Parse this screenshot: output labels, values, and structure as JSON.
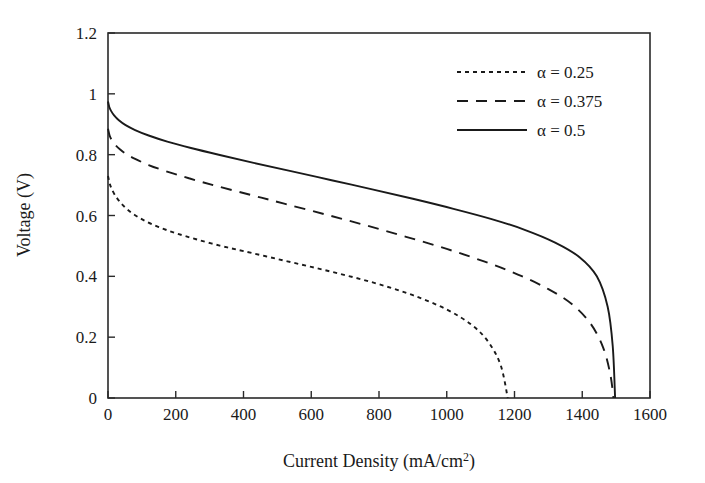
{
  "chart_data": {
    "type": "line",
    "title": "",
    "xlabel": "Current Density (mA/cm2)",
    "xlabel_main": "Current Density (mA/cm",
    "xlabel_sup": "2",
    "xlabel_tail": ")",
    "ylabel": "Voltage (V)",
    "xlim": [
      0,
      1600
    ],
    "ylim": [
      0,
      1.2
    ],
    "grid": false,
    "legend_position": "top-right",
    "xticks": [
      0,
      200,
      400,
      600,
      800,
      1000,
      1200,
      1400,
      1600
    ],
    "xtick_labels": [
      "0",
      "200",
      "400",
      "600",
      "800",
      "1000",
      "1200",
      "1400",
      "1600"
    ],
    "yticks": [
      0,
      0.2,
      0.4,
      0.6,
      0.8,
      1,
      1.2
    ],
    "ytick_labels": [
      "0",
      "0.2",
      "0.4",
      "0.6",
      "0.8",
      "1",
      "1.2"
    ],
    "series": [
      {
        "name": "alpha = 0.25",
        "legend_label": "α = 0.25",
        "style": "dotted",
        "dasharray": "4,4",
        "color": "#1a1a1a",
        "x": [
          0,
          5,
          10,
          20,
          35,
          55,
          80,
          110,
          150,
          200,
          260,
          330,
          400,
          500,
          600,
          700,
          800,
          900,
          1000,
          1075,
          1125,
          1160,
          1180
        ],
        "y": [
          0.73,
          0.705,
          0.69,
          0.668,
          0.645,
          0.622,
          0.601,
          0.582,
          0.562,
          0.542,
          0.522,
          0.501,
          0.483,
          0.457,
          0.431,
          0.404,
          0.374,
          0.338,
          0.291,
          0.239,
          0.181,
          0.105,
          0.0
        ]
      },
      {
        "name": "alpha = 0.375",
        "legend_label": "α = 0.375",
        "style": "dashed",
        "dasharray": "11,8",
        "color": "#1a1a1a",
        "x": [
          0,
          5,
          10,
          20,
          35,
          55,
          80,
          120,
          170,
          240,
          320,
          420,
          520,
          640,
          760,
          880,
          1000,
          1110,
          1210,
          1300,
          1370,
          1425,
          1462,
          1483,
          1492
        ],
        "y": [
          0.885,
          0.862,
          0.85,
          0.834,
          0.818,
          0.801,
          0.786,
          0.766,
          0.746,
          0.722,
          0.697,
          0.668,
          0.639,
          0.604,
          0.568,
          0.53,
          0.49,
          0.449,
          0.406,
          0.358,
          0.308,
          0.244,
          0.165,
          0.077,
          0.0
        ]
      },
      {
        "name": "alpha = 0.5",
        "legend_label": "α = 0.5",
        "style": "solid",
        "dasharray": "",
        "color": "#1a1a1a",
        "x": [
          0,
          4,
          9,
          18,
          32,
          52,
          80,
          120,
          175,
          245,
          330,
          430,
          540,
          660,
          780,
          900,
          1020,
          1130,
          1230,
          1320,
          1392,
          1443,
          1475,
          1490,
          1497
        ],
        "y": [
          0.975,
          0.956,
          0.944,
          0.929,
          0.913,
          0.897,
          0.881,
          0.863,
          0.843,
          0.822,
          0.799,
          0.773,
          0.746,
          0.716,
          0.686,
          0.655,
          0.622,
          0.589,
          0.553,
          0.511,
          0.463,
          0.4,
          0.3,
          0.17,
          0.0
        ]
      }
    ]
  },
  "axes": {
    "x_tick_count": 9,
    "y_tick_count": 7
  }
}
